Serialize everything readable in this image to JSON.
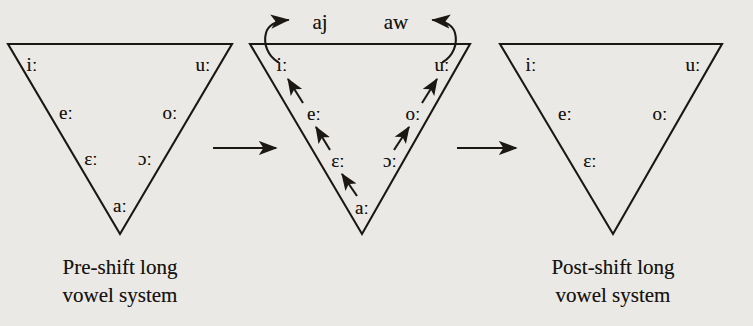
{
  "figure": {
    "kind": "vowel-shift-diagram",
    "background_color": "#eae9e6",
    "ink_color": "#1b1813",
    "width": 753,
    "height": 326
  },
  "panels": [
    {
      "id": "pre-shift",
      "caption_lines": [
        "Pre-shift long",
        "vowel system"
      ],
      "caption_center_x": 120,
      "caption_top_y": 254,
      "triangle": {
        "left_x": 8,
        "right_x": 232,
        "top_y": 44,
        "apex_x": 120,
        "apex_y": 234
      },
      "vowels": [
        {
          "symbol": "iː",
          "x": 32,
          "y": 64,
          "name": "vowel-i-long"
        },
        {
          "symbol": "uː",
          "x": 203,
          "y": 64,
          "name": "vowel-u-long"
        },
        {
          "symbol": "eː",
          "x": 66,
          "y": 112,
          "name": "vowel-e-long"
        },
        {
          "symbol": "oː",
          "x": 170,
          "y": 112,
          "name": "vowel-o-long"
        },
        {
          "symbol": "ɛː",
          "x": 91,
          "y": 158,
          "name": "vowel-open-e-long"
        },
        {
          "symbol": "ɔː",
          "x": 145,
          "y": 158,
          "name": "vowel-open-o-long"
        },
        {
          "symbol": "aː",
          "x": 120,
          "y": 205,
          "name": "vowel-a-long"
        }
      ],
      "shift_arrows": [],
      "glides": []
    },
    {
      "id": "shift-in-progress",
      "caption_lines": [],
      "caption_center_x": 362,
      "caption_top_y": 254,
      "triangle": {
        "left_x": 250,
        "right_x": 470,
        "top_y": 44,
        "apex_x": 362,
        "apex_y": 234
      },
      "vowels": [
        {
          "symbol": "iː",
          "x": 282,
          "y": 64,
          "name": "vowel-i-long"
        },
        {
          "symbol": "uː",
          "x": 442,
          "y": 64,
          "name": "vowel-u-long"
        },
        {
          "symbol": "eː",
          "x": 314,
          "y": 113,
          "name": "vowel-e-long"
        },
        {
          "symbol": "oː",
          "x": 413,
          "y": 113,
          "name": "vowel-o-long"
        },
        {
          "symbol": "ɛː",
          "x": 338,
          "y": 160,
          "name": "vowel-open-e-long"
        },
        {
          "symbol": "ɔː",
          "x": 390,
          "y": 160,
          "name": "vowel-open-o-long"
        },
        {
          "symbol": "aː",
          "x": 362,
          "y": 207,
          "name": "vowel-a-long"
        }
      ],
      "shift_arrows": [
        {
          "name": "shift-arrow-e-to-i",
          "from": "eː",
          "to": "iː"
        },
        {
          "name": "shift-arrow-eps-to-e",
          "from": "ɛː",
          "to": "eː"
        },
        {
          "name": "shift-arrow-a-to-eps",
          "from": "aː",
          "to": "ɛː"
        },
        {
          "name": "shift-arrow-o-to-u",
          "from": "oː",
          "to": "uː"
        },
        {
          "name": "shift-arrow-openo-to-o",
          "from": "ɔː",
          "to": "oː"
        }
      ],
      "glides": [
        {
          "label": "aj",
          "x": 320,
          "y": 22,
          "name": "glide-label-aj"
        },
        {
          "label": "aw",
          "x": 396,
          "y": 22,
          "name": "glide-label-aw"
        }
      ]
    },
    {
      "id": "post-shift",
      "caption_lines": [
        "Post-shift long",
        "vowel system"
      ],
      "caption_center_x": 613,
      "caption_top_y": 254,
      "triangle": {
        "left_x": 500,
        "right_x": 722,
        "top_y": 44,
        "apex_x": 613,
        "apex_y": 234
      },
      "vowels": [
        {
          "symbol": "iː",
          "x": 531,
          "y": 64,
          "name": "vowel-i-long"
        },
        {
          "symbol": "uː",
          "x": 693,
          "y": 64,
          "name": "vowel-u-long"
        },
        {
          "symbol": "eː",
          "x": 565,
          "y": 113,
          "name": "vowel-e-long"
        },
        {
          "symbol": "oː",
          "x": 660,
          "y": 113,
          "name": "vowel-o-long"
        },
        {
          "symbol": "ɛː",
          "x": 590,
          "y": 160,
          "name": "vowel-open-e-long"
        }
      ],
      "shift_arrows": [],
      "glides": []
    }
  ],
  "connectors": [
    {
      "name": "connector-arrow-1",
      "from_panel": "pre-shift",
      "to_panel": "shift-in-progress",
      "x1": 213,
      "x2": 279,
      "y": 148
    },
    {
      "name": "connector-arrow-2",
      "from_panel": "shift-in-progress",
      "to_panel": "post-shift",
      "x1": 457,
      "x2": 519,
      "y": 148
    }
  ]
}
